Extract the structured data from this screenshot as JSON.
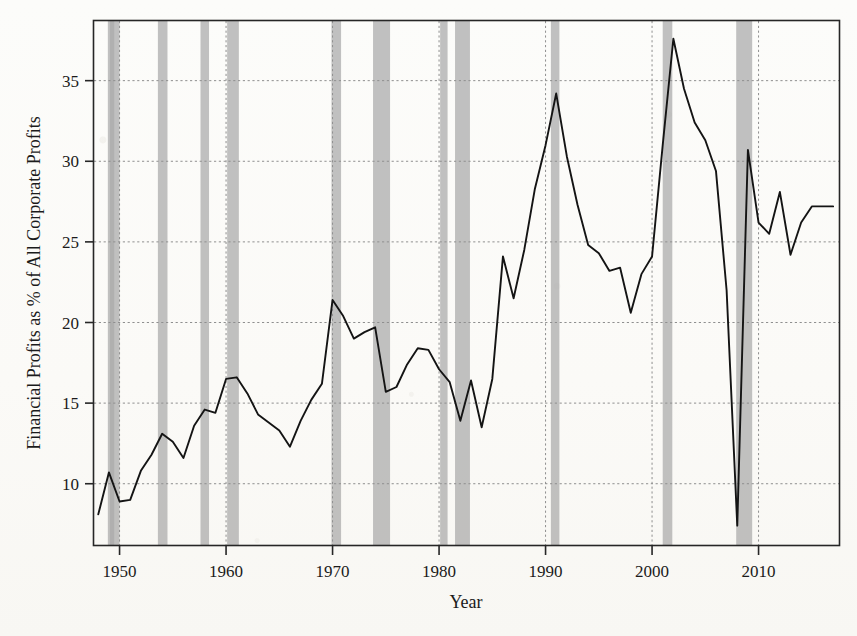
{
  "chart_data": {
    "type": "line",
    "title": "",
    "xlabel": "Year",
    "ylabel": "Financial Profits as % of All Corporate Profits",
    "xlim": [
      1947.6,
      2017.6
    ],
    "ylim": [
      6.2,
      38.7
    ],
    "xticks": [
      1950,
      1960,
      1970,
      1980,
      1990,
      2000,
      2010
    ],
    "xticklabels": [
      "1950",
      "1960",
      "1970",
      "1980",
      "1990",
      "2000",
      "2010"
    ],
    "yticks": [
      10,
      15,
      20,
      25,
      30,
      35
    ],
    "yticklabels": [
      "10",
      "15",
      "20",
      "25",
      "30",
      "35"
    ],
    "grid": "horizontal-and-vertical-dotted",
    "legend": "none",
    "series": [
      {
        "name": "Financial profits share",
        "color": "#141414",
        "x": [
          1948,
          1949,
          1950,
          1951,
          1952,
          1953,
          1954,
          1955,
          1956,
          1957,
          1958,
          1959,
          1960,
          1961,
          1962,
          1963,
          1964,
          1965,
          1966,
          1967,
          1968,
          1969,
          1970,
          1971,
          1972,
          1973,
          1974,
          1975,
          1976,
          1977,
          1978,
          1979,
          1980,
          1981,
          1982,
          1983,
          1984,
          1985,
          1986,
          1987,
          1988,
          1989,
          1990,
          1991,
          1992,
          1993,
          1994,
          1995,
          1996,
          1997,
          1998,
          1999,
          2000,
          2001,
          2002,
          2003,
          2004,
          2005,
          2006,
          2007,
          2008,
          2009,
          2010,
          2011,
          2012,
          2013,
          2014,
          2015,
          2016,
          2017
        ],
        "y": [
          8.1,
          10.7,
          8.9,
          9.0,
          10.8,
          11.8,
          13.1,
          12.6,
          11.6,
          13.6,
          14.6,
          14.4,
          16.5,
          16.6,
          15.6,
          14.3,
          13.8,
          13.3,
          12.3,
          13.9,
          15.2,
          16.2,
          21.4,
          20.4,
          19.0,
          19.4,
          19.7,
          15.7,
          16.0,
          17.4,
          18.4,
          18.3,
          17.1,
          16.3,
          13.9,
          16.4,
          13.5,
          16.5,
          24.1,
          21.5,
          24.5,
          28.3,
          31.0,
          34.2,
          30.3,
          27.3,
          24.8,
          24.3,
          23.2,
          23.4,
          20.6,
          23.0,
          24.1,
          31.0,
          37.6,
          34.5,
          32.4,
          31.3,
          29.4,
          22.0,
          7.4,
          30.7,
          26.2,
          25.5,
          28.1,
          24.2,
          26.2,
          27.2,
          27.2,
          27.2
        ]
      }
    ],
    "recession_bands": [
      {
        "start": 1948.9,
        "end": 1949.5
      },
      {
        "start": 1949.1,
        "end": 1950.0
      },
      {
        "start": 1953.6,
        "end": 1954.5
      },
      {
        "start": 1957.6,
        "end": 1958.4
      },
      {
        "start": 1960.1,
        "end": 1961.2
      },
      {
        "start": 1969.9,
        "end": 1970.8
      },
      {
        "start": 1973.8,
        "end": 1975.4
      },
      {
        "start": 1980.1,
        "end": 1980.8
      },
      {
        "start": 1981.5,
        "end": 1982.9
      },
      {
        "start": 1990.5,
        "end": 1991.3
      },
      {
        "start": 2001.0,
        "end": 2001.9
      },
      {
        "start": 2007.9,
        "end": 2009.4
      }
    ]
  }
}
